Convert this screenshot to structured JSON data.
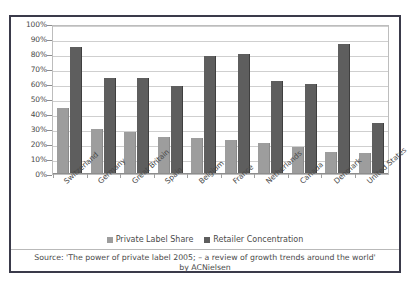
{
  "chart_data": {
    "type": "bar",
    "title": "",
    "xlabel": "",
    "ylabel": "",
    "ylim": [
      0,
      100
    ],
    "ytick_labels": [
      "100%",
      "90%",
      "80%",
      "70%",
      "60%",
      "50%",
      "40%",
      "30%",
      "20%",
      "10%",
      "0%"
    ],
    "ytick_values": [
      100,
      90,
      80,
      70,
      60,
      50,
      40,
      30,
      20,
      10,
      0
    ],
    "grid": true,
    "legend_position": "bottom",
    "categories": [
      "Switzerland",
      "Germany",
      "Great Britain",
      "Spain",
      "Belgium",
      "France",
      "Netherlands",
      "Canada",
      "Denmark",
      "United States"
    ],
    "series": [
      {
        "name": "Private Label Share",
        "color": "#9d9d9d",
        "values": [
          44,
          30,
          28,
          25,
          24,
          23,
          21,
          18,
          15,
          14
        ]
      },
      {
        "name": "Retailer Concentration",
        "color": "#5e5e5e",
        "values": [
          85,
          64,
          64,
          59,
          79,
          80,
          62,
          60,
          87,
          34
        ]
      }
    ],
    "annotations": [
      "Source: 'The power of private label 2005; – a review of growth trends around the world'",
      "by ACNielsen"
    ]
  },
  "legend": {
    "items": [
      {
        "label": "Private Label Share",
        "swatch": "light"
      },
      {
        "label": "Retailer Concentration",
        "swatch": "dark"
      }
    ]
  },
  "source": {
    "line1": "Source: 'The power of private label 2005; – a review of growth trends around the world'",
    "line2": "by ACNielsen"
  },
  "misc": {
    "top_speck": ""
  }
}
